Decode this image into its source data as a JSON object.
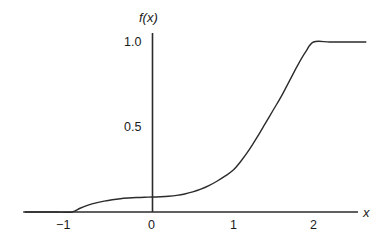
{
  "figure": {
    "background_color": "#ffffff",
    "ink_color": "#2b2b2b",
    "width": 390,
    "height": 246
  },
  "axes": {
    "y_axis_title": "f(x)",
    "x_axis_title": "x",
    "y_tick_labels": [
      "1.0",
      "0.5"
    ],
    "x_tick_labels": [
      "−1",
      "0",
      "1",
      "2"
    ]
  },
  "chart_data": {
    "type": "line",
    "title": "",
    "subtitle": "",
    "xlabel": "x",
    "ylabel": "f(x)",
    "xlim": [
      -1.6,
      2.65
    ],
    "ylim": [
      0.0,
      1.12
    ],
    "grid": false,
    "legend": null,
    "legend_position": "none",
    "x_ticks": [
      -1,
      0,
      1,
      2
    ],
    "x_tick_labels": [
      "−1",
      "0",
      "1",
      "2"
    ],
    "y_ticks": [
      0.5,
      1.0
    ],
    "y_tick_labels": [
      "0.5",
      "1.0"
    ],
    "annotations": [],
    "series": [
      {
        "name": "f(x)",
        "color": "#2b2b2b",
        "line_width": 1.4,
        "x": [
          -1.6,
          -1.4,
          -1.2,
          -1.0,
          -0.9,
          -0.8,
          -0.7,
          -0.6,
          -0.5,
          -0.4,
          -0.3,
          -0.2,
          -0.1,
          0.0,
          0.1,
          0.2,
          0.3,
          0.4,
          0.5,
          0.6,
          0.7,
          0.8,
          0.9,
          1.0,
          1.1,
          1.2,
          1.3,
          1.4,
          1.5,
          1.6,
          1.7,
          1.8,
          1.9,
          2.0,
          2.2,
          2.4,
          2.65
        ],
        "y": [
          0.0,
          0.0,
          0.0,
          0.0,
          0.022,
          0.04,
          0.054,
          0.064,
          0.072,
          0.078,
          0.082,
          0.085,
          0.087,
          0.088,
          0.09,
          0.093,
          0.098,
          0.106,
          0.118,
          0.134,
          0.155,
          0.181,
          0.211,
          0.245,
          0.3,
          0.365,
          0.44,
          0.52,
          0.6,
          0.68,
          0.77,
          0.86,
          0.94,
          1.0,
          1.0,
          1.0,
          1.0
        ]
      }
    ],
    "key_points": [
      {
        "x": -1,
        "y": 0.0,
        "note": "curve leaves the x-axis"
      },
      {
        "x": 0,
        "y": 0.088,
        "note": "value at origin"
      },
      {
        "x": 1,
        "y": 0.245,
        "note": "value at x = 1"
      },
      {
        "x": 2,
        "y": 1.0,
        "note": "curve reaches plateau"
      }
    ]
  }
}
